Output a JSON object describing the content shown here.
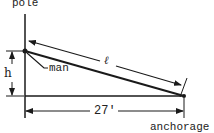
{
  "diagram": {
    "labels": {
      "pole": "pole",
      "man": "man",
      "height": "h",
      "length": "ℓ",
      "distance": "27'",
      "anchorage": "anchorage"
    },
    "colors": {
      "stroke": "#1a1a1a",
      "background": "#ffffff"
    },
    "geometry": {
      "pole": {
        "x": 25,
        "y_top": 14,
        "y_bottom": 118
      },
      "man_point": {
        "x": 25,
        "y": 51
      },
      "ground": {
        "y": 96,
        "x_start": 25,
        "x_end": 184
      },
      "anchorage_point": {
        "x": 184,
        "y": 96
      },
      "cable": {
        "from": [
          25,
          51
        ],
        "to": [
          184,
          96
        ]
      },
      "length_dimension": {
        "from": [
          27,
          41
        ],
        "to": [
          182,
          86
        ]
      },
      "height_dimension": {
        "x": 12,
        "y_top": 51,
        "y_bottom": 96
      },
      "distance_dimension": {
        "y": 111,
        "x_start": 25,
        "x_end": 184
      }
    },
    "values": {
      "horizontal_distance_ft": 27
    }
  }
}
